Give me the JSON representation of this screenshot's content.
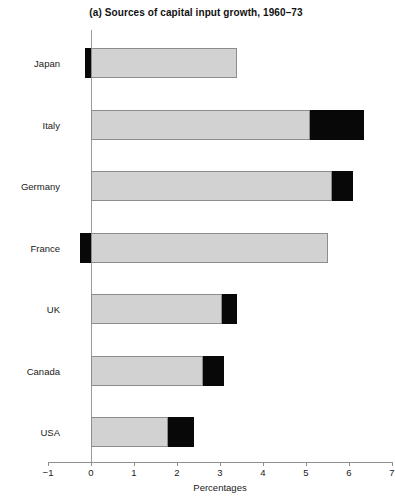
{
  "chart_data": {
    "type": "bar",
    "orientation": "horizontal",
    "stacked": true,
    "title": "(a) Sources of capital input growth, 1960–73",
    "xlabel": "Percentages",
    "ylabel": "",
    "xlim": [
      -1,
      7
    ],
    "xticks": [
      -1,
      0,
      1,
      2,
      3,
      4,
      5,
      6,
      7
    ],
    "xtick_labels": [
      "−1",
      "0",
      "1",
      "2",
      "3",
      "4",
      "5",
      "6",
      "7"
    ],
    "grid": false,
    "legend": "none",
    "categories": [
      "Japan",
      "Italy",
      "Germany",
      "France",
      "UK",
      "Canada",
      "USA"
    ],
    "series": [
      {
        "name": "grey-segment",
        "color": "#d2d2d2",
        "values": [
          3.4,
          5.1,
          5.6,
          5.5,
          3.05,
          2.6,
          1.8
        ]
      },
      {
        "name": "black-segment",
        "color": "#080808",
        "values": [
          -0.15,
          1.25,
          0.5,
          -0.25,
          0.35,
          0.5,
          0.6
        ]
      }
    ],
    "bars": [
      {
        "category": "Japan",
        "grey_start": 0.0,
        "grey_end": 3.4,
        "black_start": -0.15,
        "black_end": 0.0,
        "total": 3.4
      },
      {
        "category": "Italy",
        "grey_start": 0.0,
        "grey_end": 5.1,
        "black_start": 5.1,
        "black_end": 6.35,
        "total": 6.35
      },
      {
        "category": "Germany",
        "grey_start": 0.0,
        "grey_end": 5.6,
        "black_start": 5.6,
        "black_end": 6.1,
        "total": 6.1
      },
      {
        "category": "France",
        "grey_start": 0.0,
        "grey_end": 5.5,
        "black_start": -0.25,
        "black_end": 0.0,
        "total": 5.5
      },
      {
        "category": "UK",
        "grey_start": 0.0,
        "grey_end": 3.05,
        "black_start": 3.05,
        "black_end": 3.4,
        "total": 3.4
      },
      {
        "category": "Canada",
        "grey_start": 0.0,
        "grey_end": 2.6,
        "black_start": 2.6,
        "black_end": 3.1,
        "total": 3.1
      },
      {
        "category": "USA",
        "grey_start": 0.0,
        "grey_end": 1.8,
        "black_start": 1.8,
        "black_end": 2.4,
        "total": 2.4
      }
    ]
  }
}
